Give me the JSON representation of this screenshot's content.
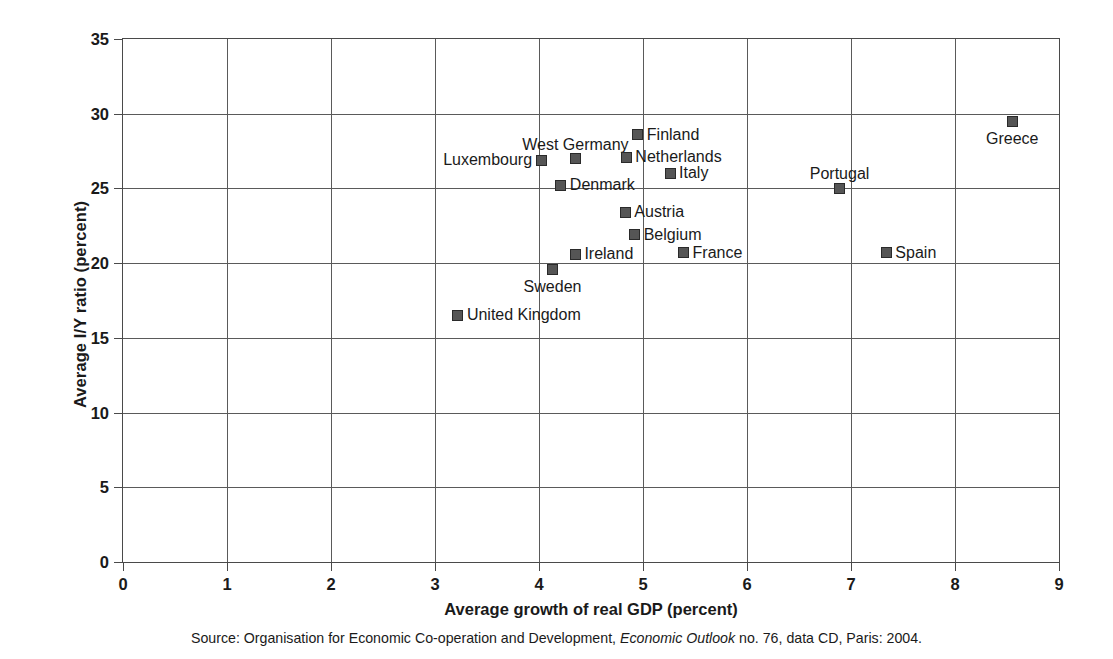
{
  "chart_data": {
    "type": "scatter",
    "title": "",
    "xlabel": "Average growth of real GDP (percent)",
    "ylabel": "Average I/Y ratio (percent)",
    "xlim": [
      0,
      9
    ],
    "ylim": [
      0,
      35
    ],
    "xticks": [
      "0",
      "1",
      "2",
      "3",
      "4",
      "5",
      "6",
      "7",
      "8",
      "9"
    ],
    "yticks": [
      "0",
      "5",
      "10",
      "15",
      "20",
      "25",
      "30",
      "35"
    ],
    "grid": true,
    "legend": "none",
    "marker_color": "#555555",
    "points": [
      {
        "label": "Luxembourg",
        "x": 4.02,
        "y": 26.9,
        "label_pos": "left"
      },
      {
        "label": "West Germany",
        "x": 4.35,
        "y": 27.0,
        "label_pos": "above"
      },
      {
        "label": "Finland",
        "x": 4.95,
        "y": 28.6,
        "label_pos": "right"
      },
      {
        "label": "Netherlands",
        "x": 4.84,
        "y": 27.1,
        "label_pos": "right"
      },
      {
        "label": "Italy",
        "x": 5.26,
        "y": 26.0,
        "label_pos": "right"
      },
      {
        "label": "Denmark",
        "x": 4.21,
        "y": 25.2,
        "label_pos": "right"
      },
      {
        "label": "Austria",
        "x": 4.83,
        "y": 23.4,
        "label_pos": "right"
      },
      {
        "label": "Belgium",
        "x": 4.92,
        "y": 21.9,
        "label_pos": "right"
      },
      {
        "label": "France",
        "x": 5.39,
        "y": 20.7,
        "label_pos": "right"
      },
      {
        "label": "Ireland",
        "x": 4.35,
        "y": 20.6,
        "label_pos": "right"
      },
      {
        "label": "Sweden",
        "x": 4.13,
        "y": 19.6,
        "label_pos": "below"
      },
      {
        "label": "United Kingdom",
        "x": 3.22,
        "y": 16.5,
        "label_pos": "right"
      },
      {
        "label": "Portugal",
        "x": 6.89,
        "y": 25.0,
        "label_pos": "above"
      },
      {
        "label": "Spain",
        "x": 7.34,
        "y": 20.7,
        "label_pos": "right"
      },
      {
        "label": "Greece",
        "x": 8.55,
        "y": 29.5,
        "label_pos": "below"
      }
    ]
  },
  "source": {
    "prefix": "Source: Organisation for Economic Co-operation and Development, ",
    "italic": "Economic Outlook",
    "suffix": " no. 76, data CD, Paris: 2004."
  }
}
